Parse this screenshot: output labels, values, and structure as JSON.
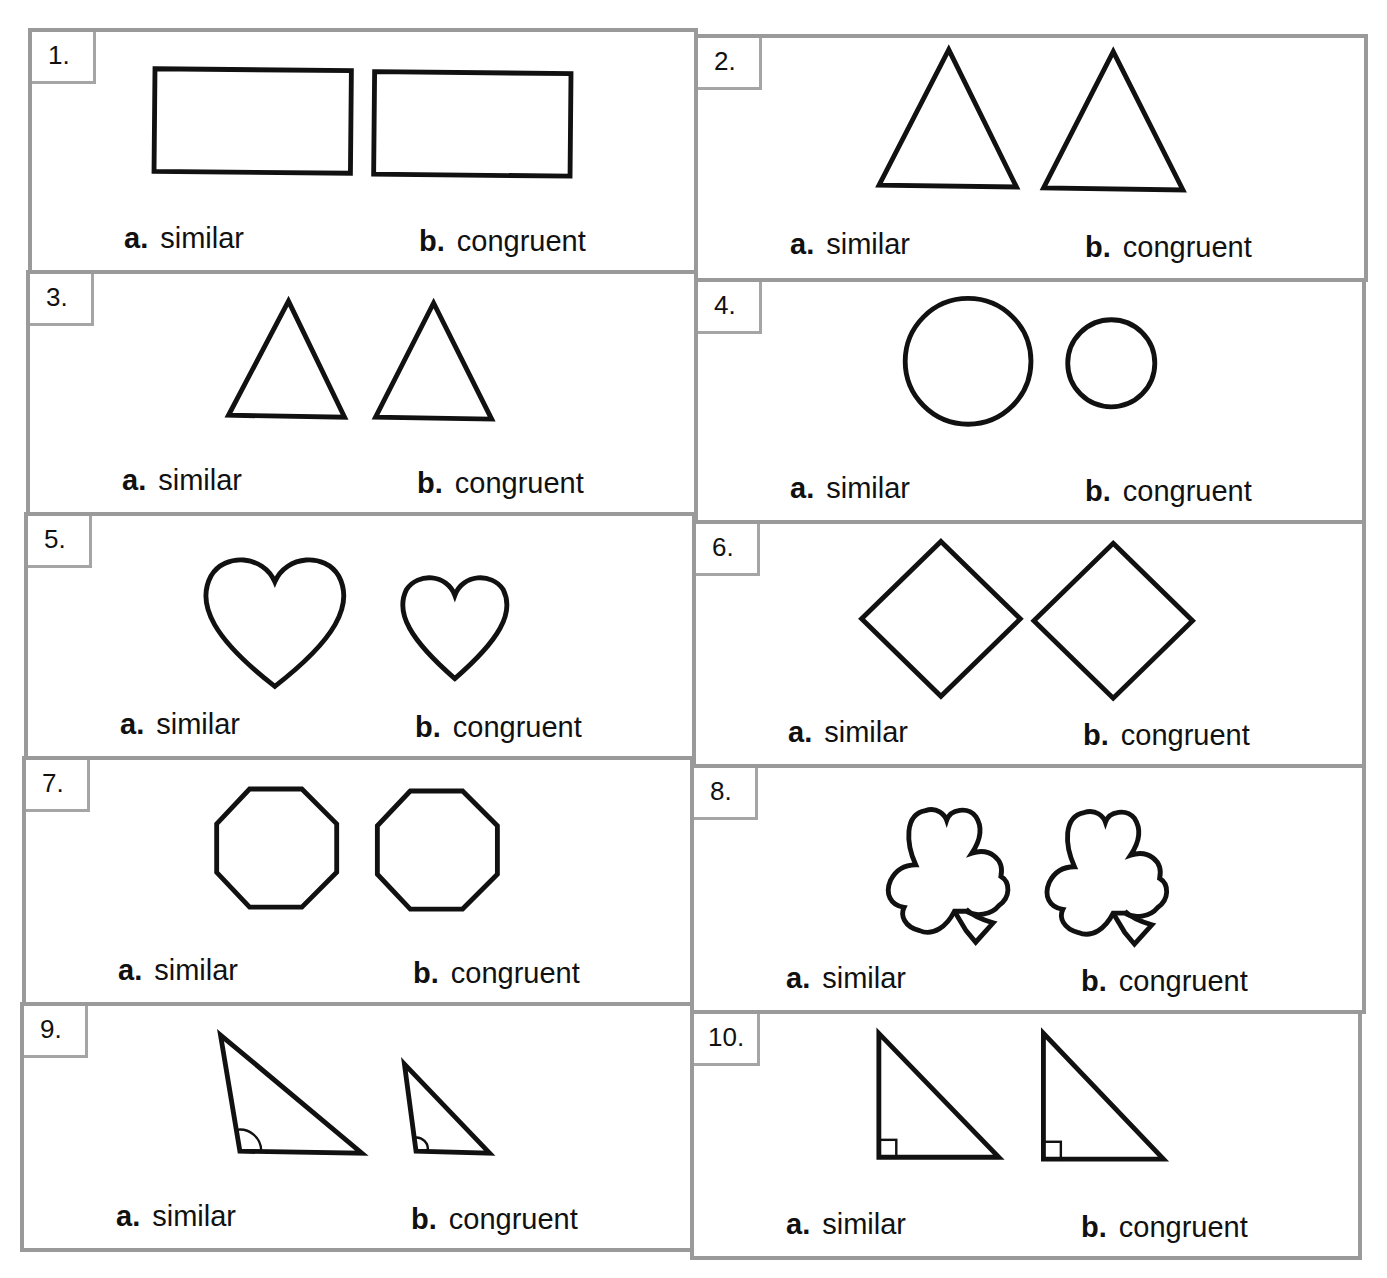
{
  "worksheet": {
    "option_a_letter": "a.",
    "option_b_letter": "b.",
    "problems": [
      {
        "number": "1.",
        "shapes": "rectangle-pair",
        "option_a": "similar",
        "option_b": "congruent"
      },
      {
        "number": "2.",
        "shapes": "triangle-pair",
        "option_a": "similar",
        "option_b": "congruent"
      },
      {
        "number": "3.",
        "shapes": "triangle-pair",
        "option_a": "similar",
        "option_b": "congruent"
      },
      {
        "number": "4.",
        "shapes": "circle-pair",
        "option_a": "similar",
        "option_b": "congruent"
      },
      {
        "number": "5.",
        "shapes": "heart-pair",
        "option_a": "similar",
        "option_b": "congruent"
      },
      {
        "number": "6.",
        "shapes": "diamond-pair",
        "option_a": "similar",
        "option_b": "congruent"
      },
      {
        "number": "7.",
        "shapes": "octagon-pair",
        "option_a": "similar",
        "option_b": "congruent"
      },
      {
        "number": "8.",
        "shapes": "shamrock-pair",
        "option_a": "similar",
        "option_b": "congruent"
      },
      {
        "number": "9.",
        "shapes": "obtuse-triangle-pair",
        "option_a": "similar",
        "option_b": "congruent"
      },
      {
        "number": "10.",
        "shapes": "right-triangle-pair",
        "option_a": "similar",
        "option_b": "congruent"
      }
    ]
  }
}
